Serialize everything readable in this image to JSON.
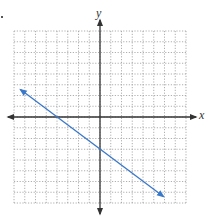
{
  "chart_data": {
    "type": "line",
    "title": "",
    "xlabel": "x",
    "ylabel": "y",
    "xlim": [
      -8,
      8
    ],
    "ylim": [
      -8,
      8
    ],
    "grid": true,
    "grid_style": "dotted",
    "tick_labels": false,
    "series": [
      {
        "name": "line",
        "equation": "y = -3/4 x - 3",
        "slope": -0.75,
        "y_intercept": -3,
        "x_intercept": -4,
        "color": "#3a78c9",
        "x": [
          -7.4,
          -4,
          0,
          5.9
        ],
        "y": [
          2.55,
          0,
          -3,
          -7.4
        ],
        "arrows_both_ends": true
      }
    ]
  },
  "labels": {
    "x_axis": "x",
    "y_axis": "y"
  },
  "colors": {
    "axis": "#333333",
    "grid": "#9a9a9a",
    "line": "#3a78c9"
  }
}
